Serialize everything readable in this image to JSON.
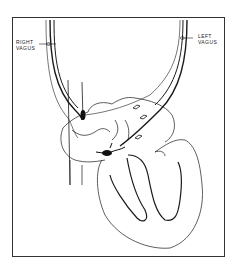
{
  "figure": {
    "labels": {
      "right_vagus_line1": "RIGHT",
      "right_vagus_line2": "VAGUS",
      "left_vagus_line1": "LEFT",
      "left_vagus_line2": "VAGUS"
    },
    "colors": {
      "line": "#1a1a1a",
      "background": "#ffffff",
      "frame": "#333333"
    }
  }
}
